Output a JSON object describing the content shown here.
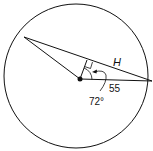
{
  "diagram": {
    "labels": {
      "chord": "H",
      "radius": "55",
      "angle": "72°"
    },
    "colors": {
      "stroke": "#111111",
      "background": "#ffffff"
    }
  }
}
